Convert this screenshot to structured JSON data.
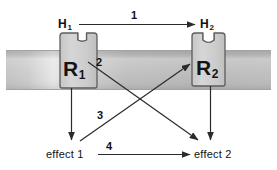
{
  "diagram": {
    "membrane": {
      "name": "cell-membrane-band",
      "fill_dark": "#b9b9b9",
      "fill_light": "#e8e8e8",
      "border": "#9a9a9a"
    },
    "receptors": [
      {
        "id": "r1",
        "label": "R",
        "subscript": "1",
        "fill": "#cfcfcf",
        "stroke": "#5a5a5a"
      },
      {
        "id": "r2",
        "label": "R",
        "subscript": "2",
        "fill": "#cfcfcf",
        "stroke": "#5a5a5a"
      }
    ],
    "ligands": [
      {
        "id": "h1",
        "label": "H",
        "subscript": "1"
      },
      {
        "id": "h2",
        "label": "H",
        "subscript": "2"
      }
    ],
    "effects": [
      {
        "id": "effect1",
        "label": "effect 1"
      },
      {
        "id": "effect2",
        "label": "effect 2"
      }
    ],
    "arrows": [
      {
        "id": "arrow1",
        "number": "1",
        "from": "H1",
        "to": "H2",
        "description": "horizontal arrow from ligand H1 to ligand H2"
      },
      {
        "id": "arrow2",
        "number": "2",
        "from": "R1",
        "to": "effect 2",
        "description": "diagonal arrow from receptor R1 down-right to effect 2"
      },
      {
        "id": "arrow3",
        "number": "3",
        "from": "effect 1",
        "to": "R2",
        "description": "diagonal arrow from effect 1 up-right to receptor R2"
      },
      {
        "id": "arrow4",
        "number": "4",
        "from": "effect 1",
        "to": "effect 2",
        "description": "horizontal arrow from effect 1 to effect 2"
      },
      {
        "id": "arrow-r1-effect1",
        "number": "",
        "from": "R1",
        "to": "effect 1",
        "description": "vertical arrow from receptor R1 down to effect 1"
      },
      {
        "id": "arrow-r2-effect2",
        "number": "",
        "from": "R2",
        "to": "effect 2",
        "description": "vertical arrow from receptor R2 down to effect 2"
      }
    ],
    "line_color": "#2b2b2b"
  }
}
